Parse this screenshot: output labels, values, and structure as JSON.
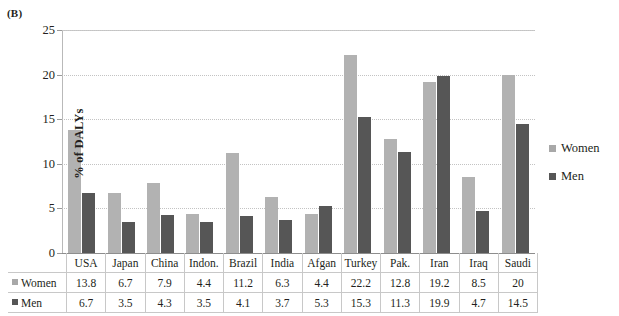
{
  "panel_label": "(B)",
  "legend": {
    "items": [
      {
        "label": "Women",
        "color": "#b2b2b2",
        "icon": "square-swatch-icon"
      },
      {
        "label": "Men",
        "color": "#565656",
        "icon": "square-swatch-icon"
      }
    ]
  },
  "table": {
    "row_labels": [
      "Women",
      "Men"
    ]
  },
  "chart_data": {
    "type": "bar",
    "title": "(B)",
    "xlabel": "",
    "ylabel": "% of DALYs",
    "ylim": [
      0,
      25
    ],
    "yticks": [
      0,
      5,
      10,
      15,
      20,
      25
    ],
    "grid": true,
    "legend_position": "right",
    "categories": [
      "USA",
      "Japan",
      "China",
      "Indon.",
      "Brazil",
      "India",
      "Afgan",
      "Turkey",
      "Pak.",
      "Iran",
      "Iraq",
      "Saudi"
    ],
    "series": [
      {
        "name": "Women",
        "color": "#b2b2b2",
        "values": [
          13.8,
          6.7,
          7.9,
          4.4,
          11.2,
          6.3,
          4.4,
          22.2,
          12.8,
          19.2,
          8.5,
          20
        ]
      },
      {
        "name": "Men",
        "color": "#565656",
        "values": [
          6.7,
          3.5,
          4.3,
          3.5,
          4.1,
          3.7,
          5.3,
          15.3,
          11.3,
          19.9,
          4.7,
          14.5
        ]
      }
    ]
  }
}
